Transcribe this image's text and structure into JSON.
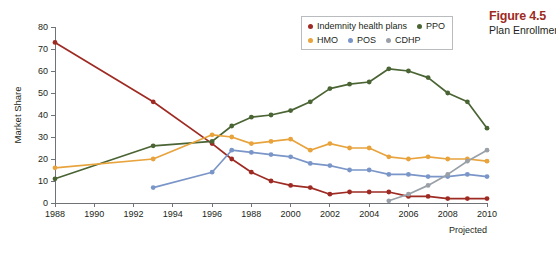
{
  "figure": {
    "number": "Figure 4.5",
    "caption": "Plan Enrollment"
  },
  "legend": {
    "rows": [
      [
        {
          "label": "Indemnity health plans",
          "color": "#9e2b23"
        },
        {
          "label": "PPO",
          "color": "#4a6434"
        }
      ],
      [
        {
          "label": "HMO",
          "color": "#e8a33d"
        },
        {
          "label": "POS",
          "color": "#7a95c8"
        },
        {
          "label": "CDHP",
          "color": "#9aa0a8"
        }
      ]
    ]
  },
  "annotations": {
    "projected": "Projected"
  },
  "chart_data": {
    "type": "line",
    "title": "Plan Enrollment",
    "xlabel": "",
    "ylabel": "Market Share",
    "ylim": [
      0,
      80
    ],
    "ytick_values": [
      0,
      10,
      20,
      30,
      40,
      50,
      60,
      70,
      80
    ],
    "ytick_labels": [
      "0",
      "10",
      "20",
      "30",
      "40",
      "50",
      "60",
      "70",
      "80"
    ],
    "xlim": [
      1988,
      2010
    ],
    "xtick_values": [
      1988,
      1990,
      1992,
      1994,
      1996,
      1998,
      2000,
      2002,
      2004,
      2006,
      2008,
      2010
    ],
    "xtick_labels": [
      "1988",
      "1990",
      "1992",
      "1994",
      "1996",
      "1988",
      "2000",
      "2002",
      "2004",
      "2006",
      "2008",
      "2010"
    ],
    "grid": false,
    "legend_position": "top-right",
    "series": [
      {
        "name": "Indemnity health plans",
        "color": "#9e2b23",
        "x": [
          1988,
          1993,
          1996,
          1997,
          1998,
          1999,
          2000,
          2001,
          2002,
          2003,
          2004,
          2005,
          2006,
          2007,
          2008,
          2009,
          2010
        ],
        "values": [
          73,
          46,
          27,
          20,
          14,
          10,
          8,
          7,
          4,
          5,
          5,
          5,
          3,
          3,
          2,
          2,
          2
        ]
      },
      {
        "name": "PPO",
        "color": "#4a6434",
        "x": [
          1988,
          1993,
          1996,
          1997,
          1998,
          1999,
          2000,
          2001,
          2002,
          2003,
          2004,
          2005,
          2006,
          2007,
          2008,
          2009,
          2010
        ],
        "values": [
          11,
          26,
          28,
          35,
          39,
          40,
          42,
          46,
          52,
          54,
          55,
          61,
          60,
          57,
          50,
          46,
          34
        ]
      },
      {
        "name": "HMO",
        "color": "#e8a33d",
        "x": [
          1988,
          1993,
          1996,
          1997,
          1998,
          1999,
          2000,
          2001,
          2002,
          2003,
          2004,
          2005,
          2006,
          2007,
          2008,
          2009,
          2010
        ],
        "values": [
          16,
          20,
          31,
          30,
          27,
          28,
          29,
          24,
          27,
          25,
          25,
          21,
          20,
          21,
          20,
          20,
          19
        ]
      },
      {
        "name": "POS",
        "color": "#7a95c8",
        "x": [
          1993,
          1996,
          1997,
          1998,
          1999,
          2000,
          2001,
          2002,
          2003,
          2004,
          2005,
          2006,
          2007,
          2008,
          2009,
          2010
        ],
        "values": [
          7,
          14,
          24,
          23,
          22,
          21,
          18,
          17,
          15,
          15,
          13,
          13,
          12,
          12,
          13,
          12
        ]
      },
      {
        "name": "CDHP",
        "color": "#9aa0a8",
        "x": [
          2005,
          2006,
          2007,
          2008,
          2009,
          2010
        ],
        "values": [
          1,
          4,
          8,
          13,
          19,
          24
        ]
      }
    ]
  }
}
